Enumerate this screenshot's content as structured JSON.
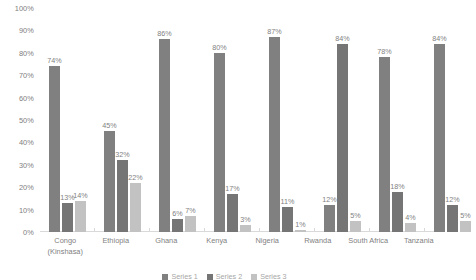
{
  "chart_data": {
    "type": "bar",
    "title": "",
    "subtitle": "",
    "xlabel": "",
    "ylabel": "",
    "ylim": [
      0,
      100
    ],
    "grid": false,
    "legend_position": "bottom",
    "value_suffix": "%",
    "categories": [
      "Congo (Kinshasa)",
      "Ethiopia",
      "Ghana",
      "Kenya",
      "Nigeria",
      "Rwanda",
      "South Africa",
      "Tanzania"
    ],
    "y_ticks": [
      "0%",
      "10%",
      "20%",
      "30%",
      "40%",
      "50%",
      "60%",
      "70%",
      "80%",
      "90%",
      "100%"
    ],
    "series": [
      {
        "name": "Series 1",
        "color": "#808080",
        "values": [
          74,
          45,
          86,
          80,
          87,
          12,
          78,
          84
        ],
        "labels": [
          "74%",
          "45%",
          "86%",
          "80%",
          "87%",
          "12%",
          "78%",
          "84%"
        ]
      },
      {
        "name": "Series 2",
        "color": "#757575",
        "values": [
          13,
          32,
          6,
          17,
          11,
          84,
          18,
          12
        ],
        "labels": [
          "13%",
          "32%",
          "6%",
          "17%",
          "11%",
          "84%",
          "18%",
          "12%"
        ]
      },
      {
        "name": "Series 3",
        "color": "#c2c2c2",
        "values": [
          14,
          22,
          7,
          3,
          1,
          5,
          4,
          5
        ],
        "labels": [
          "14%",
          "22%",
          "7%",
          "3%",
          "1%",
          "5%",
          "4%",
          "5%"
        ]
      }
    ]
  }
}
